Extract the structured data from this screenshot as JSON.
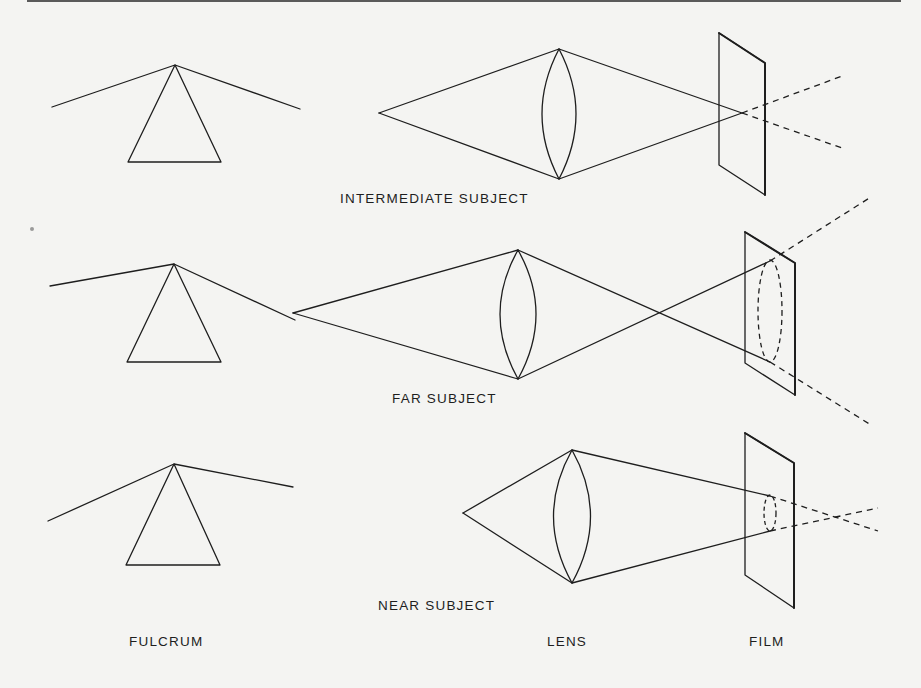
{
  "figure": {
    "panels": [
      {
        "id": "intermediate",
        "caption": "INTERMEDIATE SUBJECT"
      },
      {
        "id": "far",
        "caption": "FAR SUBJECT"
      },
      {
        "id": "near",
        "caption": "NEAR SUBJECT"
      }
    ],
    "column_labels": {
      "fulcrum": "FULCRUM",
      "lens": "LENS",
      "film": "FILM"
    }
  }
}
